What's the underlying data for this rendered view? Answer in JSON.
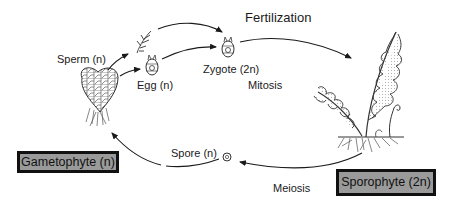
{
  "labels": {
    "fertilization": "Fertilization",
    "sperm": "Sperm (n)",
    "egg": "Egg (n)",
    "zygote": "Zygote (2n)",
    "mitosis": "Mitosis",
    "spore": "Spore (n)",
    "meiosis": "Meiosis"
  },
  "boxes": {
    "gametophyte": "Gametophyte (n)",
    "sporophyte": "Sporophyte (2n)"
  },
  "colors": {
    "box_fill": "#9a9a9a",
    "box_border": "#111111",
    "line": "#1a1a1a"
  },
  "stages": [
    {
      "id": "gametophyte",
      "label": "Gametophyte (n)",
      "drawing": "heart-shaped prothallus"
    },
    {
      "id": "sperm",
      "label": "Sperm (n)"
    },
    {
      "id": "egg",
      "label": "Egg (n)"
    },
    {
      "id": "zygote",
      "label": "Zygote (2n)"
    },
    {
      "id": "sporophyte",
      "label": "Sporophyte (2n)",
      "drawing": "mature fern with fronds and roots"
    },
    {
      "id": "spore",
      "label": "Spore (n)"
    }
  ],
  "transitions": [
    {
      "from": "gametophyte",
      "to": "sperm"
    },
    {
      "from": "gametophyte",
      "to": "egg"
    },
    {
      "from": "sperm",
      "to": "zygote",
      "label": "Fertilization"
    },
    {
      "from": "egg",
      "to": "zygote",
      "label": "Fertilization"
    },
    {
      "from": "zygote",
      "to": "sporophyte",
      "label": "Mitosis"
    },
    {
      "from": "sporophyte",
      "to": "spore",
      "label": "Meiosis"
    },
    {
      "from": "spore",
      "to": "gametophyte"
    }
  ]
}
